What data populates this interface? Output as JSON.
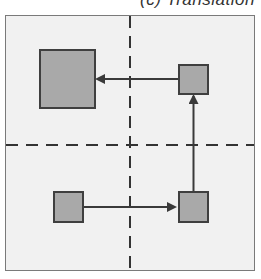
{
  "figure": {
    "title": "(c) Translation",
    "colors": {
      "panel_bg": "#f1f1f1",
      "panel_border": "#7a7a7a",
      "shape_fill": "#a9a9a9",
      "shape_stroke": "#3f3f3f",
      "arrow": "#3a3a3a",
      "guide": "#333333"
    },
    "guides": {
      "vertical_x": 130,
      "horizontal_y": 145,
      "style": "dashed"
    },
    "shapes": [
      {
        "id": "large-square",
        "x": 40,
        "y": 50,
        "w": 55,
        "h": 58
      },
      {
        "id": "top-right-square",
        "x": 179,
        "y": 65,
        "w": 29,
        "h": 29
      },
      {
        "id": "bottom-left-square",
        "x": 54,
        "y": 192,
        "w": 29,
        "h": 30
      },
      {
        "id": "bottom-right-square",
        "x": 179,
        "y": 192,
        "w": 29,
        "h": 30
      }
    ],
    "arrows": [
      {
        "id": "arrow-right",
        "from": "bottom-left-square",
        "to": "bottom-right-square",
        "direction": "right"
      },
      {
        "id": "arrow-up",
        "from": "bottom-right-square",
        "to": "top-right-square",
        "direction": "up"
      },
      {
        "id": "arrow-left",
        "from": "top-right-square",
        "to": "large-square",
        "direction": "left"
      }
    ]
  }
}
